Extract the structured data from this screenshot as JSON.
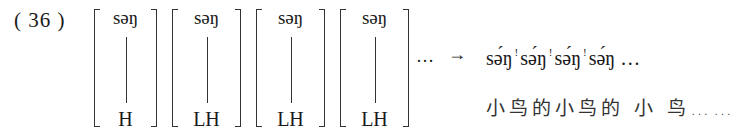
{
  "example_number": "( 36 )",
  "matrices": [
    {
      "syllable": "səŋ",
      "tone": "H"
    },
    {
      "syllable": "səŋ",
      "tone": "LH"
    },
    {
      "syllable": "səŋ",
      "tone": "LH"
    },
    {
      "syllable": "səŋ",
      "tone": "LH"
    }
  ],
  "continuation": "…",
  "arrow": "→",
  "output": {
    "syllables": [
      "sə́ŋ",
      "sə́ŋ",
      "sə́ŋ",
      "sə́ŋ"
    ],
    "downstep_mark": "!",
    "trailing": "…"
  },
  "gloss": "小鸟的小鸟的 小 鸟……"
}
